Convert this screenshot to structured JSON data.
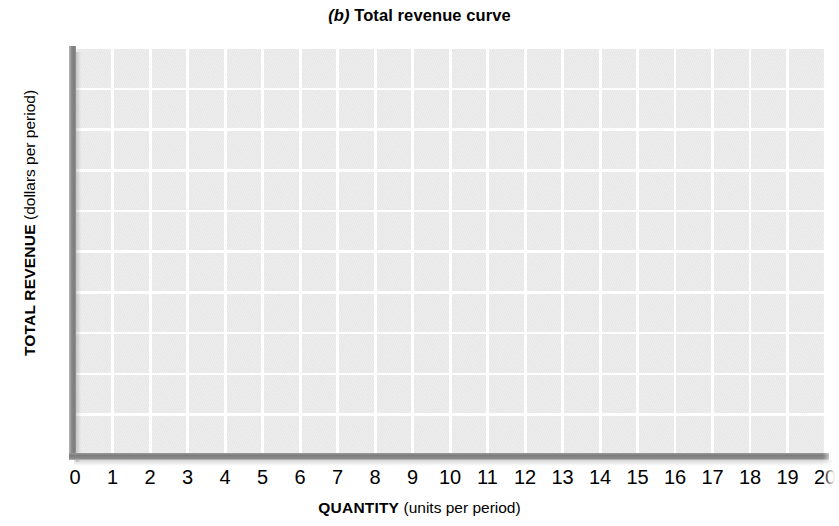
{
  "figure": {
    "panel_letter": "(b)",
    "title_text": " Total revenue curve"
  },
  "chart_data": {
    "type": "line",
    "title": "(b) Total revenue curve",
    "xlabel": "QUANTITY (units per period)",
    "ylabel": "TOTAL REVENUE (dollars per period)",
    "xlim": [
      0,
      20
    ],
    "ylim": [
      0,
      50
    ],
    "grid": true,
    "legend": null,
    "x_major_tick_step": 1,
    "y_major_tick_step": 10,
    "y_gridline_step": 5,
    "x_tick_labels": [
      "0",
      "1",
      "2",
      "3",
      "4",
      "5",
      "6",
      "7",
      "8",
      "9",
      "10",
      "11",
      "12",
      "13",
      "14",
      "15",
      "16",
      "17",
      "18",
      "19",
      "20"
    ],
    "y_tick_labels": [
      "$50",
      "40",
      "30",
      "20",
      "10"
    ],
    "y_tick_values": [
      50,
      40,
      30,
      20,
      10
    ],
    "series": [],
    "annotations": [],
    "note": "Blank plotting grid — no data curve is drawn in the figure."
  },
  "axes": {
    "y": {
      "title_main": "TOTAL REVENUE",
      "title_units": " (dollars per period)",
      "ticks": [
        {
          "label": "$50",
          "value": 50
        },
        {
          "label": "40",
          "value": 40
        },
        {
          "label": "30",
          "value": 30
        },
        {
          "label": "20",
          "value": 20
        },
        {
          "label": "10",
          "value": 10
        }
      ]
    },
    "x": {
      "title_main": "QUANTITY",
      "title_units": " (units per period)",
      "ticks": [
        {
          "label": "0",
          "value": 0
        },
        {
          "label": "1",
          "value": 1
        },
        {
          "label": "2",
          "value": 2
        },
        {
          "label": "3",
          "value": 3
        },
        {
          "label": "4",
          "value": 4
        },
        {
          "label": "5",
          "value": 5
        },
        {
          "label": "6",
          "value": 6
        },
        {
          "label": "7",
          "value": 7
        },
        {
          "label": "8",
          "value": 8
        },
        {
          "label": "9",
          "value": 9
        },
        {
          "label": "10",
          "value": 10
        },
        {
          "label": "11",
          "value": 11
        },
        {
          "label": "12",
          "value": 12
        },
        {
          "label": "13",
          "value": 13
        },
        {
          "label": "14",
          "value": 14
        },
        {
          "label": "15",
          "value": 15
        },
        {
          "label": "16",
          "value": 16
        },
        {
          "label": "17",
          "value": 17
        },
        {
          "label": "18",
          "value": 18
        },
        {
          "label": "19",
          "value": 19
        },
        {
          "label": "20",
          "value": 20
        }
      ]
    }
  },
  "colors": {
    "plot_background": "#e9e9e9",
    "gridline": "#ffffff",
    "axis_line": "#808080",
    "text": "#000000",
    "page_background": "#ffffff"
  }
}
